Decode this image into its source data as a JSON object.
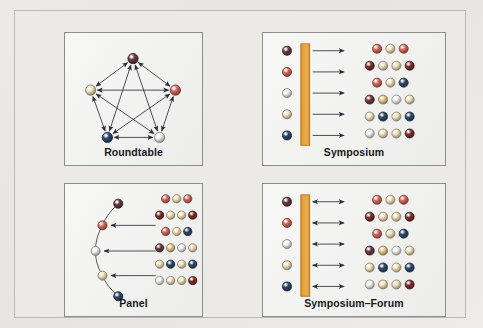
{
  "figure": {
    "background_color": "#e9e8e4",
    "panel_background": "#f4f4f2",
    "panel_border_color": "#8d8d8b",
    "bar_color": "#e8a33d",
    "bar_border_color": "#b9761f",
    "arrow_color": "#2b2f36",
    "edge_color": "#2b2f36",
    "label_color": "#15171a"
  },
  "palette": {
    "maroon": "#6b3a44",
    "darkred": "#7e2f2d",
    "salmon": "#d9685c",
    "cream": "#f2e2bc",
    "tan": "#e8c98b",
    "white": "#f2f1ee",
    "navy": "#2f4a6b",
    "darkgray": "#4a4a55"
  },
  "quadrants": [
    {
      "id": "roundtable",
      "label": "Roundtable",
      "type": "network",
      "description": "Five participants arranged in a pentagon, every pair joined by a double-headed arrow",
      "nodes": [
        {
          "index": 0,
          "position": "top",
          "x": 69,
          "y": 26,
          "color": "maroon"
        },
        {
          "index": 1,
          "position": "right",
          "x": 112,
          "y": 58,
          "color": "salmon"
        },
        {
          "index": 2,
          "position": "bottom-right",
          "x": 96,
          "y": 106,
          "color": "white"
        },
        {
          "index": 3,
          "position": "bottom-left",
          "x": 43,
          "y": 106,
          "color": "navy"
        },
        {
          "index": 4,
          "position": "left",
          "x": 26,
          "y": 58,
          "color": "cream"
        }
      ],
      "edges": [
        [
          0,
          1
        ],
        [
          0,
          2
        ],
        [
          0,
          3
        ],
        [
          0,
          4
        ],
        [
          1,
          2
        ],
        [
          1,
          3
        ],
        [
          1,
          4
        ],
        [
          2,
          3
        ],
        [
          2,
          4
        ],
        [
          3,
          4
        ]
      ],
      "edge_style": "double-headed"
    },
    {
      "id": "symposium",
      "label": "Symposium",
      "type": "speakers-bar-audience",
      "description": "Five speakers behind an orange lectern bar, five one-way arrows to the audience",
      "speakers": [
        {
          "index": 0,
          "color": "maroon"
        },
        {
          "index": 1,
          "color": "salmon"
        },
        {
          "index": 2,
          "color": "white"
        },
        {
          "index": 3,
          "color": "cream"
        },
        {
          "index": 4,
          "color": "navy"
        }
      ],
      "bar": {
        "label": "lectern-bar",
        "color": "#e8a33d"
      },
      "arrows": {
        "count": 5,
        "direction": "right",
        "style": "single-headed"
      },
      "audience_rows": [
        {
          "indent": 1,
          "colors": [
            "salmon",
            "cream",
            "salmon"
          ]
        },
        {
          "indent": 0,
          "colors": [
            "darkred",
            "cream",
            "cream",
            "darkred"
          ]
        },
        {
          "indent": 1,
          "colors": [
            "salmon",
            "cream",
            "navy"
          ]
        },
        {
          "indent": 0,
          "colors": [
            "maroon",
            "tan",
            "white",
            "cream"
          ]
        },
        {
          "indent": 0,
          "colors": [
            "cream",
            "navy",
            "cream",
            "navy"
          ]
        },
        {
          "indent": 0,
          "colors": [
            "white",
            "cream",
            "cream",
            "darkred"
          ]
        }
      ]
    },
    {
      "id": "panel",
      "label": "Panel",
      "type": "arc-audience",
      "description": "Five panelists on a curved arc, three one-way arrows pointing left from the audience",
      "panelists": [
        {
          "index": 0,
          "x": 54,
          "y": 20,
          "color": "maroon"
        },
        {
          "index": 1,
          "x": 38,
          "y": 42,
          "color": "salmon"
        },
        {
          "index": 2,
          "x": 31,
          "y": 68,
          "color": "white"
        },
        {
          "index": 3,
          "x": 38,
          "y": 93,
          "color": "cream"
        },
        {
          "index": 4,
          "x": 54,
          "y": 114,
          "color": "navy"
        }
      ],
      "arrows": {
        "count": 3,
        "direction": "left",
        "style": "single-headed"
      },
      "audience_rows": [
        {
          "indent": 1,
          "colors": [
            "salmon",
            "cream",
            "salmon"
          ]
        },
        {
          "indent": 0,
          "colors": [
            "darkred",
            "cream",
            "cream",
            "darkred"
          ]
        },
        {
          "indent": 1,
          "colors": [
            "salmon",
            "cream",
            "navy"
          ]
        },
        {
          "indent": 0,
          "colors": [
            "maroon",
            "tan",
            "white",
            "cream"
          ]
        },
        {
          "indent": 0,
          "colors": [
            "cream",
            "navy",
            "cream",
            "navy"
          ]
        },
        {
          "indent": 0,
          "colors": [
            "white",
            "cream",
            "cream",
            "darkred"
          ]
        }
      ]
    },
    {
      "id": "symposium-forum",
      "label": "Symposium–Forum",
      "type": "speakers-bar-audience",
      "description": "Five speakers behind an orange bar with five double-headed arrows to and from the audience",
      "speakers": [
        {
          "index": 0,
          "color": "maroon"
        },
        {
          "index": 1,
          "color": "salmon"
        },
        {
          "index": 2,
          "color": "white"
        },
        {
          "index": 3,
          "color": "cream"
        },
        {
          "index": 4,
          "color": "navy"
        }
      ],
      "bar": {
        "label": "lectern-bar",
        "color": "#e8a33d"
      },
      "arrows": {
        "count": 5,
        "direction": "both",
        "style": "double-headed"
      },
      "audience_rows": [
        {
          "indent": 1,
          "colors": [
            "salmon",
            "cream",
            "salmon"
          ]
        },
        {
          "indent": 0,
          "colors": [
            "darkred",
            "cream",
            "cream",
            "darkred"
          ]
        },
        {
          "indent": 1,
          "colors": [
            "salmon",
            "cream",
            "navy"
          ]
        },
        {
          "indent": 0,
          "colors": [
            "maroon",
            "tan",
            "white",
            "cream"
          ]
        },
        {
          "indent": 0,
          "colors": [
            "cream",
            "navy",
            "cream",
            "navy"
          ]
        },
        {
          "indent": 0,
          "colors": [
            "white",
            "cream",
            "cream",
            "darkred"
          ]
        }
      ]
    }
  ]
}
